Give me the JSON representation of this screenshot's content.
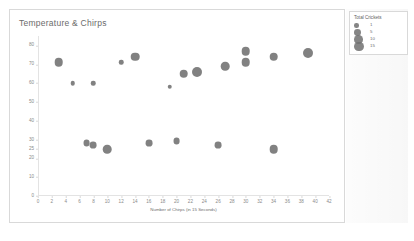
{
  "chart_data": {
    "type": "scatter",
    "title": "Temperature & Chirps",
    "xlabel": "Number of Chirps (in 15 Seconds)",
    "ylabel": "Temperature (Fahrenheit)",
    "xlim": [
      0,
      42
    ],
    "ylim": [
      0,
      85
    ],
    "grid": false,
    "legend_position": "top-right",
    "xticks": [
      0,
      2,
      4,
      6,
      8,
      10,
      12,
      14,
      16,
      18,
      20,
      22,
      24,
      26,
      28,
      30,
      32,
      34,
      36,
      38,
      40,
      42
    ],
    "yticks": [
      0,
      10,
      20,
      25,
      30,
      40,
      50,
      60,
      70,
      80
    ],
    "ytick_labels": [
      "0",
      "10",
      "20",
      "25",
      "30",
      "40",
      "50",
      "60",
      "70",
      "80"
    ],
    "marker_color": "#707070",
    "size_field": "Total Crickets",
    "points": [
      {
        "x": 3,
        "y": 71,
        "size": 10
      },
      {
        "x": 5,
        "y": 60,
        "size": 1
      },
      {
        "x": 8,
        "y": 60,
        "size": 1
      },
      {
        "x": 7,
        "y": 28,
        "size": 5
      },
      {
        "x": 8,
        "y": 27,
        "size": 5
      },
      {
        "x": 10,
        "y": 25,
        "size": 10
      },
      {
        "x": 12,
        "y": 71,
        "size": 1
      },
      {
        "x": 14,
        "y": 74,
        "size": 10
      },
      {
        "x": 16,
        "y": 28,
        "size": 5
      },
      {
        "x": 19,
        "y": 58,
        "size": 1
      },
      {
        "x": 20,
        "y": 29,
        "size": 5
      },
      {
        "x": 21,
        "y": 65,
        "size": 10
      },
      {
        "x": 23,
        "y": 66,
        "size": 15
      },
      {
        "x": 26,
        "y": 27,
        "size": 5
      },
      {
        "x": 27,
        "y": 69,
        "size": 10
      },
      {
        "x": 30,
        "y": 77,
        "size": 10
      },
      {
        "x": 30,
        "y": 71,
        "size": 10
      },
      {
        "x": 34,
        "y": 74,
        "size": 10
      },
      {
        "x": 34,
        "y": 25,
        "size": 10
      },
      {
        "x": 39,
        "y": 76,
        "size": 15
      }
    ],
    "legend": {
      "title": "Total Crickets",
      "entries": [
        {
          "label": "1",
          "size": 1
        },
        {
          "label": "5",
          "size": 5
        },
        {
          "label": "10",
          "size": 10
        },
        {
          "label": "15",
          "size": 15
        }
      ]
    }
  }
}
